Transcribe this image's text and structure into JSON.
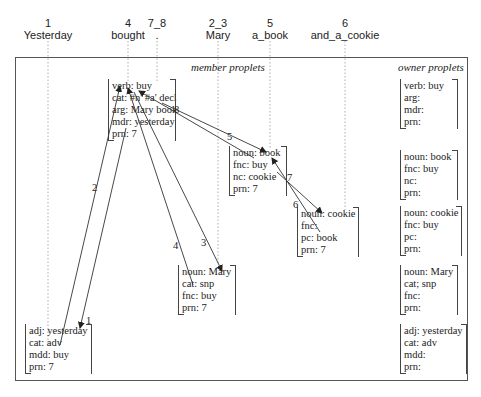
{
  "words": [
    {
      "index": "1",
      "text": "Yesterday",
      "x": 48
    },
    {
      "index": "4",
      "text": "bought",
      "x": 128
    },
    {
      "index": "7_8",
      "text": ".",
      "x": 156
    },
    {
      "index": "2_3",
      "text": "Mary",
      "x": 218
    },
    {
      "index": "5",
      "text": "a_book",
      "x": 270
    },
    {
      "index": "6",
      "text": "and_a_cookie",
      "x": 345
    }
  ],
  "sections": {
    "member_title": "member proplets",
    "owner_title": "owner proplets"
  },
  "member_proplets": [
    {
      "id": "buy",
      "rows": [
        "verb: buy",
        "cat: #n' #a' decl",
        "arg: Mary book",
        "mdr: yesterday",
        "prn: 7"
      ]
    },
    {
      "id": "book",
      "rows": [
        "noun: book",
        "fnc: buy",
        "nc: cookie",
        "prn: 7"
      ]
    },
    {
      "id": "cookie",
      "rows": [
        "noun: cookie",
        "fnc:",
        "pc: book",
        "prn: 7"
      ]
    },
    {
      "id": "mary",
      "rows": [
        "noun: Mary",
        "cat: snp",
        "fnc: buy",
        "prn: 7"
      ]
    },
    {
      "id": "yesterday",
      "rows": [
        "adj: yesterday",
        "cat: adv",
        "mdd: buy",
        "prn: 7"
      ]
    }
  ],
  "owner_proplets": [
    {
      "id": "buy",
      "rows": [
        "verb: buy",
        "arg:",
        "mdr:",
        "prn:"
      ]
    },
    {
      "id": "book",
      "rows": [
        "noun: book",
        "fnc: buy",
        "nc:",
        "prn:"
      ]
    },
    {
      "id": "cookie",
      "rows": [
        "noun: cookie",
        "fnc: buy",
        "pc:",
        "prn:"
      ]
    },
    {
      "id": "mary",
      "rows": [
        "noun: Mary",
        "cat; snp",
        "fnc:",
        "prn:"
      ]
    },
    {
      "id": "yesterday",
      "rows": [
        "adj: yesterday",
        "cat: adv",
        "mdd:",
        "prn:"
      ]
    }
  ],
  "edges": [
    {
      "label": "1",
      "from": "buy",
      "to": "yesterday"
    },
    {
      "label": "2",
      "from": "yesterday",
      "to": "buy"
    },
    {
      "label": "3",
      "from": "buy",
      "to": "mary"
    },
    {
      "label": "4",
      "from": "mary",
      "to": "buy"
    },
    {
      "label": "5",
      "from": "buy",
      "to": "book"
    },
    {
      "label": "6",
      "from": "book",
      "to": "cookie"
    },
    {
      "label": "7",
      "from": "cookie",
      "to": "book"
    },
    {
      "label": "8",
      "from": "book",
      "to": "buy"
    }
  ],
  "colors": {
    "line": "#333333",
    "text": "#222222",
    "guide": "#999999"
  }
}
